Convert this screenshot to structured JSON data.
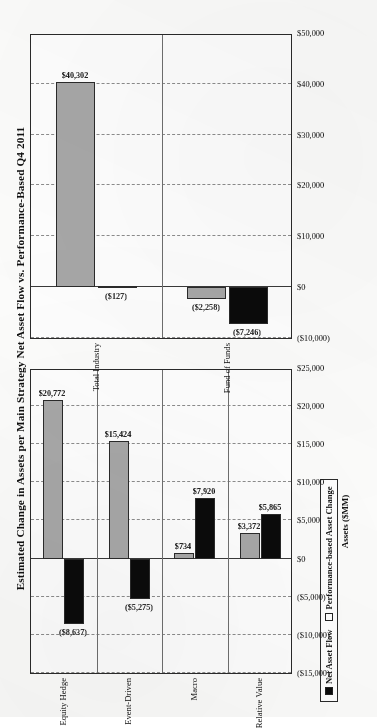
{
  "document": {
    "title": "Estimated Change in Assets per Main Strategy Net Asset Flow vs. Performance-Based Q4 2011"
  },
  "legend": {
    "items": [
      {
        "key": "net_asset_flow",
        "label": "Net Asset Flow",
        "color": "#0b0b0b",
        "marker": "filled-square"
      },
      {
        "key": "performance_based",
        "label": "Performance-based Asset Change",
        "color": "#a8a8a8",
        "marker": "hollow-square"
      }
    ]
  },
  "chart_data": [
    {
      "id": "industry-chart",
      "type": "bar",
      "orientation": "horizontal",
      "title": "Estimated Change in Assets per Main Strategy Net Asset Flow vs. Performance-Based Q4 2011",
      "xlabel": "",
      "ylabel": "",
      "grid": true,
      "legend_position": "bottom-right",
      "categories": [
        "Total Industry",
        "Fund of Funds"
      ],
      "axis_ticks": [
        "$50,000",
        "$40,000",
        "$30,000",
        "$20,000",
        "$10,000",
        "$0",
        "($10,000)"
      ],
      "axis_tick_values": [
        50000,
        40000,
        30000,
        20000,
        10000,
        0,
        -10000
      ],
      "xlim": [
        -10000,
        50000
      ],
      "series": [
        {
          "name": "Net Asset Flow",
          "color": "#0b0b0b",
          "values": [
            -127,
            -7246
          ],
          "labels": [
            "($127)",
            "($7,246)"
          ]
        },
        {
          "name": "Performance-based Asset Change",
          "color": "#a8a8a8",
          "values": [
            40302,
            -2258
          ],
          "labels": [
            "$40,302",
            "($2,258)"
          ]
        }
      ]
    },
    {
      "id": "strategy-chart",
      "type": "bar",
      "orientation": "horizontal",
      "title": "Estimated Change in Assets per Main Strategy Net Asset Flow vs. Performance-Based Q4 2011",
      "xlabel": "",
      "ylabel": "Assets ($MM)",
      "grid": true,
      "legend_position": "bottom-right",
      "categories": [
        "Equity Hedge",
        "Event-Driven",
        "Macro",
        "Relative Value"
      ],
      "axis_ticks": [
        "$25,000",
        "$20,000",
        "$15,000",
        "$10,000",
        "$5,000",
        "$0",
        "($5,000)",
        "($10,000)",
        "($15,000)"
      ],
      "axis_tick_values": [
        25000,
        20000,
        15000,
        10000,
        5000,
        0,
        -5000,
        -10000,
        -15000
      ],
      "xlim": [
        -15000,
        25000
      ],
      "series": [
        {
          "name": "Net Asset Flow",
          "color": "#0b0b0b",
          "values": [
            -8637,
            -5275,
            7920,
            5865
          ],
          "labels": [
            "($8,637)",
            "($5,275)",
            "$7,920",
            "$5,865"
          ]
        },
        {
          "name": "Performance-based Asset Change",
          "color": "#a8a8a8",
          "values": [
            20772,
            15424,
            734,
            3372
          ],
          "labels": [
            "$20,772",
            "$15,424",
            "$734",
            "$3,372"
          ]
        }
      ]
    }
  ]
}
